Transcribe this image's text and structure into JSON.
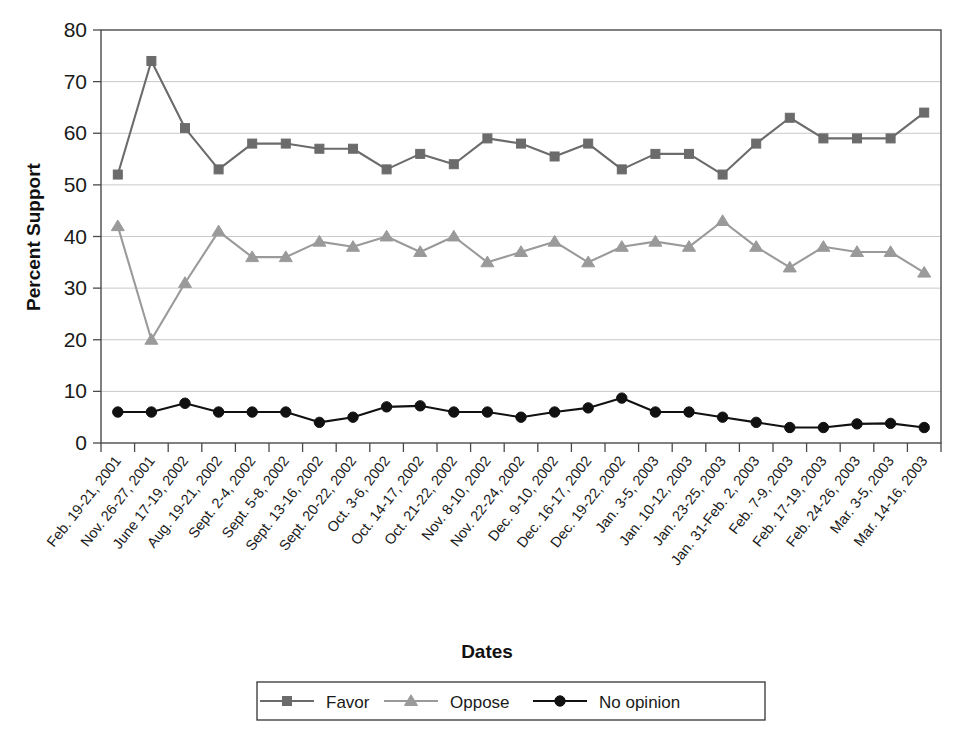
{
  "chart_data": {
    "type": "line",
    "title": "",
    "xlabel": "Dates",
    "ylabel": "Percent Support",
    "ylim": [
      0,
      80
    ],
    "ytick_step": 10,
    "yticks": [
      "0",
      "10",
      "20",
      "30",
      "40",
      "50",
      "60",
      "70",
      "80"
    ],
    "grid": true,
    "legend_position": "bottom",
    "categories": [
      "Feb. 19-21, 2001",
      "Nov. 26-27, 2001",
      "June 17-19, 2002",
      "Aug. 19-21, 2002",
      "Sept. 2-4, 2002",
      "Sept. 5-8, 2002",
      "Sept. 13-16, 2002",
      "Sept. 20-22, 2002",
      "Oct. 3-6, 2002",
      "Oct. 14-17, 2002",
      "Oct. 21-22, 2002",
      "Nov. 8-10, 2002",
      "Nov. 22-24, 2002",
      "Dec. 9-10, 2002",
      "Dec. 16-17, 2002",
      "Dec. 19-22, 2002",
      "Jan. 3-5, 2003",
      "Jan. 10-12, 2003",
      "Jan. 23-25, 2003",
      "Jan. 31-Feb. 2, 2003",
      "Feb. 7-9, 2003",
      "Feb. 17-19, 2003",
      "Feb. 24-26, 2003",
      "Mar. 3-5, 2003",
      "Mar. 14-16, 2003"
    ],
    "series": [
      {
        "name": "Favor",
        "marker": "square",
        "color": "#6b6b6b",
        "values": [
          52,
          74,
          61,
          53,
          58,
          58,
          57,
          57,
          53,
          56,
          54,
          59,
          58,
          55.5,
          58,
          53,
          56,
          56,
          52,
          58,
          63,
          59,
          59,
          59,
          64
        ]
      },
      {
        "name": "Oppose",
        "marker": "triangle",
        "color": "#9a9a9a",
        "values": [
          42,
          20,
          31,
          41,
          36,
          36,
          39,
          38,
          40,
          37,
          40,
          35,
          37,
          39,
          35,
          38,
          39,
          38,
          43,
          38,
          34,
          38,
          37,
          37,
          33
        ]
      },
      {
        "name": "No opinion",
        "marker": "circle",
        "color": "#111111",
        "values": [
          6,
          6,
          7.7,
          6,
          6,
          6,
          4,
          5,
          7,
          7.2,
          6,
          6,
          5,
          6,
          6.8,
          8.7,
          6,
          6,
          5,
          4,
          3,
          3,
          3.7,
          3.8,
          3
        ]
      }
    ]
  },
  "legend": {
    "items": [
      {
        "label": "Favor"
      },
      {
        "label": "Oppose"
      },
      {
        "label": "No opinion"
      }
    ]
  }
}
